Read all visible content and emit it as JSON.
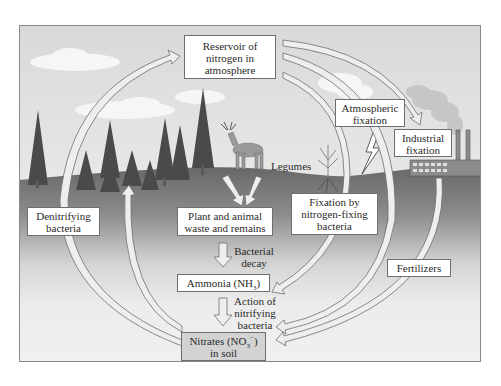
{
  "diagram": {
    "colors": {
      "frame_border": "#8a8a8a",
      "sky_top": "#dcdcdc",
      "sky_bottom": "#f2f2f2",
      "ground_top": "#6a6a6a",
      "ground_bottom": "#f0f0f0",
      "arrow_fill": "#eeeeee",
      "arrow_stroke": "#6e6e6e",
      "box_fill": "#ffffff",
      "nitrates_box_fill": "#d3d3d3"
    },
    "boxes": {
      "reservoir": {
        "lines": [
          "Reservoir of",
          "nitrogen in",
          "atmosphere"
        ]
      },
      "atmospheric_fixation": {
        "lines": [
          "Atmospheric",
          "fixation"
        ]
      },
      "industrial_fixation": {
        "lines": [
          "Industrial",
          "fixation"
        ]
      },
      "denitrifying": {
        "lines": [
          "Denitrifying",
          "bacteria"
        ]
      },
      "plant_animal": {
        "lines": [
          "Plant and animal",
          "waste and remains"
        ]
      },
      "fixation_bacteria": {
        "lines": [
          "Fixation by",
          "nitrogen-fixing",
          "bacteria"
        ]
      },
      "ammonia": {
        "text": "Ammonia (NH",
        "sub": "3",
        "close": ")"
      },
      "fertilizers": {
        "text": "Fertilizers"
      },
      "nitrates": {
        "text": "Nitrates (NO",
        "sub": "3",
        "sup": "−",
        "close": ")",
        "line2": "in soil"
      }
    },
    "notes": {
      "legumes": "Legumes",
      "bacterial_decay": [
        "Bacterial",
        "decay"
      ],
      "nitrifying": [
        "Action of",
        "nitrifying",
        "bacteria"
      ]
    },
    "illustrations": [
      "conifer-trees",
      "deer",
      "legume-plant",
      "clouds",
      "lightning-bolt",
      "factory-with-smokestacks",
      "smoke"
    ],
    "flows": [
      {
        "from": "Denitrifying bacteria",
        "to": "Reservoir of nitrogen in atmosphere"
      },
      {
        "from": "Reservoir of nitrogen in atmosphere",
        "to": "Industrial fixation"
      },
      {
        "from": "Reservoir of nitrogen in atmosphere",
        "to": "Nitrates in soil",
        "via": "Atmospheric fixation"
      },
      {
        "from": "Reservoir of nitrogen in atmosphere",
        "to": "Ammonia",
        "via": "Fixation by nitrogen-fixing bacteria"
      },
      {
        "from": "Industrial fixation",
        "to": "Nitrates in soil",
        "via": "Fertilizers"
      },
      {
        "from": "Plant and animal waste and remains",
        "to": "Ammonia",
        "via": "Bacterial decay"
      },
      {
        "from": "Ammonia",
        "to": "Nitrates in soil",
        "via": "Action of nitrifying bacteria"
      },
      {
        "from": "Nitrates in soil",
        "to": "Trees (plant uptake)"
      },
      {
        "from": "Nitrates in soil",
        "to": "Denitrifying bacteria"
      }
    ]
  }
}
